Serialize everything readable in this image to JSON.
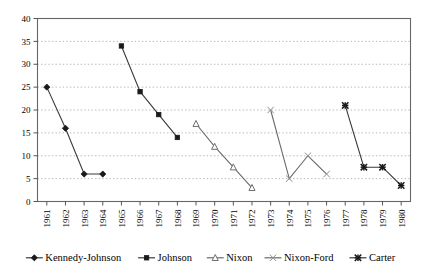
{
  "chart_data": {
    "type": "line",
    "title": "",
    "xlabel": "",
    "ylabel": "",
    "x": [
      1961,
      1962,
      1963,
      1964,
      1965,
      1966,
      1967,
      1968,
      1969,
      1970,
      1971,
      1972,
      1973,
      1974,
      1975,
      1976,
      1977,
      1978,
      1979,
      1980
    ],
    "xtick_labels": [
      "1961",
      "1962",
      "1963",
      "1964",
      "1965",
      "1966",
      "1967",
      "1968",
      "1969",
      "1970",
      "1971",
      "1972",
      "1973",
      "1974",
      "1975",
      "1976",
      "1977",
      "1978",
      "1979",
      "1980"
    ],
    "ylim": [
      0,
      40
    ],
    "yticks": [
      0,
      5,
      10,
      15,
      20,
      25,
      30,
      35,
      40
    ],
    "ytick_labels": [
      "0",
      "5",
      "10",
      "15",
      "20",
      "25",
      "30",
      "35",
      "40"
    ],
    "grid": "horizontal-dotted",
    "legend_position": "bottom",
    "series": [
      {
        "name": "Kennedy-Johnson",
        "marker": "filled-diamond",
        "color": "#1a1a1a",
        "x": [
          1961,
          1962,
          1963,
          1964
        ],
        "values": [
          25,
          16,
          6,
          6
        ]
      },
      {
        "name": "Johnson",
        "marker": "filled-square",
        "color": "#1a1a1a",
        "x": [
          1965,
          1966,
          1967,
          1968
        ],
        "values": [
          34,
          24,
          19,
          14
        ]
      },
      {
        "name": "Nixon",
        "marker": "open-triangle",
        "color": "#6e6e6e",
        "x": [
          1969,
          1970,
          1971,
          1972
        ],
        "values": [
          17,
          12,
          7.5,
          3
        ]
      },
      {
        "name": "Nixon-Ford",
        "marker": "asterisk-gray",
        "color": "#8c8c8c",
        "x": [
          1973,
          1974,
          1975,
          1976
        ],
        "values": [
          20,
          5,
          10,
          6
        ]
      },
      {
        "name": "Carter",
        "marker": "asterisk-dark",
        "color": "#1a1a1a",
        "x": [
          1977,
          1978,
          1979,
          1980
        ],
        "values": [
          21,
          7.5,
          7.5,
          3.5
        ]
      }
    ]
  },
  "legend": {
    "items": [
      {
        "label": "Kennedy-Johnson",
        "marker": "filled-diamond"
      },
      {
        "label": "Johnson",
        "marker": "filled-square"
      },
      {
        "label": "Nixon",
        "marker": "open-triangle"
      },
      {
        "label": "Nixon-Ford",
        "marker": "asterisk-gray"
      },
      {
        "label": "Carter",
        "marker": "asterisk-dark"
      }
    ]
  }
}
